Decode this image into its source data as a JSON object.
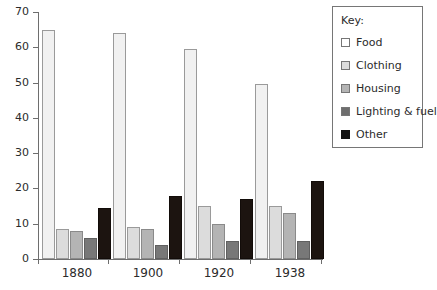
{
  "chart_data": {
    "type": "bar",
    "title": "",
    "subtitle": "",
    "xlabel": "",
    "ylabel": "",
    "categories": [
      "1880",
      "1900",
      "1920",
      "1938"
    ],
    "series": [
      {
        "name": "Food",
        "values": [
          65,
          64,
          59.5,
          49.5
        ],
        "color": "#f1f1f1"
      },
      {
        "name": "Clothing",
        "values": [
          8.5,
          9,
          15,
          15
        ],
        "color": "#dcdcdc"
      },
      {
        "name": "Housing",
        "values": [
          8,
          8.5,
          10,
          13
        ],
        "color": "#b4b4b4"
      },
      {
        "name": "Lighting & fuel",
        "values": [
          6,
          4,
          5,
          5
        ],
        "color": "#6e6e6e"
      },
      {
        "name": "Other",
        "values": [
          14.5,
          18,
          17,
          22
        ],
        "color": "#121212"
      }
    ],
    "ylim": [
      0,
      70
    ],
    "ytick_step": 10,
    "yticks": [
      "0",
      "10",
      "20",
      "30",
      "40",
      "50",
      "60",
      "70"
    ],
    "grid": false,
    "legend_position": "top-right"
  },
  "legend": {
    "title": "Key:",
    "entries": [
      {
        "label": "Food"
      },
      {
        "label": "Clothing"
      },
      {
        "label": "Housing"
      },
      {
        "label": "Lighting & fuel"
      },
      {
        "label": "Other"
      }
    ]
  }
}
